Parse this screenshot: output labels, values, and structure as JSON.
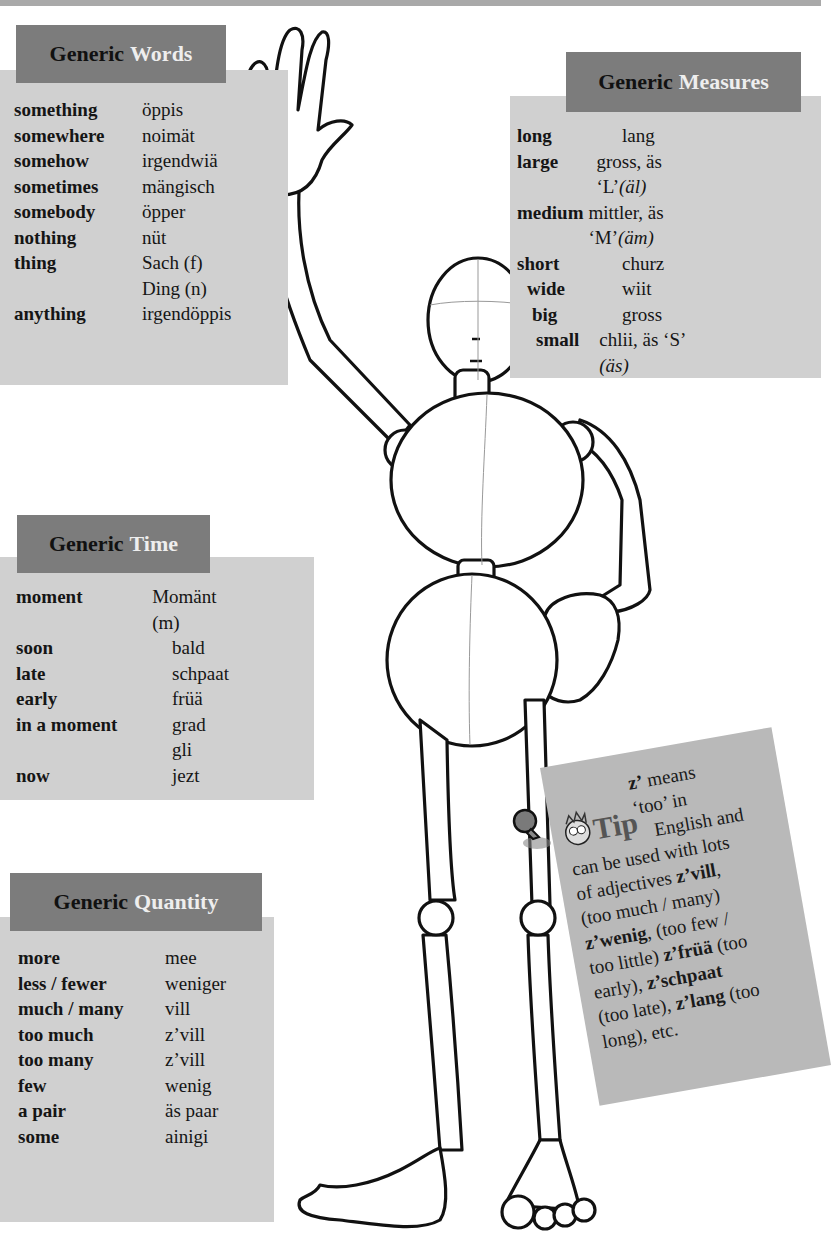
{
  "boxes": {
    "words": {
      "title_1": "Generic",
      "title_2": "Words",
      "rows": [
        {
          "en": "something",
          "ch": "öppis"
        },
        {
          "en": "somewhere",
          "ch": "noimät"
        },
        {
          "en": "somehow",
          "ch": "irgendwiä"
        },
        {
          "en": "sometimes",
          "ch": "mängisch"
        },
        {
          "en": "somebody",
          "ch": "öpper"
        },
        {
          "en": "nothing",
          "ch": "nüt"
        },
        {
          "en": "thing",
          "ch": "Sach (f)"
        },
        {
          "en": "",
          "ch": "Ding (n)"
        },
        {
          "en": "anything",
          "ch": "irgendöppis"
        }
      ]
    },
    "measures": {
      "title_1": "Generic",
      "title_2": "Measures",
      "rows": [
        {
          "en": "long",
          "ch": "lang",
          "note": ""
        },
        {
          "en": "large",
          "ch": "gross, äs ‘L’",
          "note": "(äl)"
        },
        {
          "en": "medium",
          "ch": "mittler, äs ‘M’",
          "note": "(äm)"
        },
        {
          "en": "short",
          "ch": "churz",
          "note": ""
        },
        {
          "en": "wide",
          "ch": "wiit",
          "note": ""
        },
        {
          "en": "big",
          "ch": "gross",
          "note": ""
        },
        {
          "en": "small",
          "ch": "chlii, äs ‘S’ ",
          "note": "(äs)"
        }
      ]
    },
    "time": {
      "title_1": "Generic",
      "title_2": "Time",
      "rows": [
        {
          "en": "moment",
          "ch": "Momänt (m)"
        },
        {
          "en": "soon",
          "ch": "bald"
        },
        {
          "en": "late",
          "ch": "schpaat"
        },
        {
          "en": "early",
          "ch": "früä"
        },
        {
          "en": "in a moment",
          "ch": "grad"
        },
        {
          "en": "",
          "ch": "gli"
        },
        {
          "en": "now",
          "ch": "jezt"
        }
      ]
    },
    "quantity": {
      "title_1": "Generic",
      "title_2": "Quantity",
      "rows": [
        {
          "en": "more",
          "ch": "mee"
        },
        {
          "en": "less / fewer",
          "ch": "weniger"
        },
        {
          "en": "much / many",
          "ch": "vill"
        },
        {
          "en": "too much",
          "ch": "z’vill"
        },
        {
          "en": "too many",
          "ch": "z’vill"
        },
        {
          "en": "few",
          "ch": "wenig"
        },
        {
          "en": "a pair",
          "ch": "äs paar"
        },
        {
          "en": "some",
          "ch": "ainigi"
        }
      ]
    }
  },
  "tip": {
    "logo": "Tip",
    "lines": [
      {
        "b": "z’",
        "t": " means"
      },
      {
        "b": "",
        "t": "‘too’ in"
      },
      {
        "b": "",
        "t": "English and"
      },
      {
        "b": "",
        "t": "can be used with lots"
      },
      {
        "pre": "of adjectives ",
        "b": "z’vill",
        "t": ","
      },
      {
        "b": "",
        "t": "(too much / many)"
      },
      {
        "b": "z’wenig",
        "t": ", (too few /"
      },
      {
        "pre": "too little) ",
        "b": "z’früä",
        "t": " (too"
      },
      {
        "pre": "early), ",
        "b": "z’schpaat",
        "t": ""
      },
      {
        "pre": "(too late), ",
        "b": "z’lang",
        "t": " (too"
      },
      {
        "b": "",
        "t": "long), etc."
      }
    ]
  },
  "illustration": {
    "description": "wooden mannequin figure waving"
  },
  "colors": {
    "panel": "#d0d0d0",
    "header": "#7c7c7c",
    "tip": "#b9b9b9",
    "topbar": "#a9a9a9"
  }
}
